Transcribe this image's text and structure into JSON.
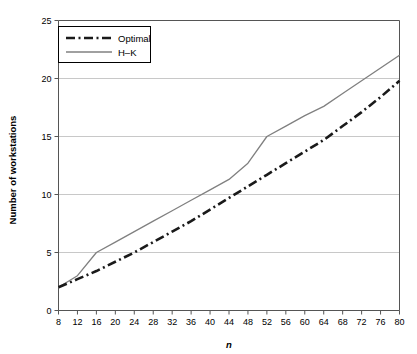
{
  "chart_data": {
    "type": "line",
    "title": "",
    "xlabel": "n",
    "ylabel": "Number of workstations",
    "xlim": [
      8,
      80
    ],
    "ylim": [
      0,
      25
    ],
    "xticks": [
      8,
      12,
      16,
      20,
      24,
      28,
      32,
      36,
      40,
      44,
      48,
      52,
      56,
      60,
      64,
      68,
      72,
      76,
      80
    ],
    "yticks": [
      0,
      5,
      10,
      15,
      20,
      25
    ],
    "grid": "horizontal",
    "legend_position": "top-left",
    "x": [
      8,
      12,
      16,
      20,
      24,
      28,
      32,
      36,
      40,
      44,
      48,
      52,
      56,
      60,
      64,
      68,
      72,
      76,
      80
    ],
    "series": [
      {
        "name": "Optimal",
        "style": "dash-dot",
        "color": "#1a1a1a",
        "values": [
          2.0,
          2.7,
          3.4,
          4.2,
          5.0,
          5.9,
          6.8,
          7.7,
          8.7,
          9.7,
          10.7,
          11.7,
          12.7,
          13.7,
          14.7,
          15.9,
          17.1,
          18.4,
          19.8
        ]
      },
      {
        "name": "H–K",
        "style": "solid",
        "color": "#808080",
        "values": [
          2.0,
          3.0,
          5.0,
          5.9,
          6.8,
          7.7,
          8.6,
          9.5,
          10.4,
          11.3,
          12.7,
          15.0,
          15.9,
          16.8,
          17.6,
          18.7,
          19.8,
          20.9,
          22.0
        ]
      }
    ]
  },
  "legend": {
    "entries": [
      {
        "label": "Optimal"
      },
      {
        "label": "H–K"
      }
    ]
  },
  "axes": {
    "y_title": "Number of workstations",
    "x_title": "n",
    "y_tick_labels": [
      "0",
      "5",
      "10",
      "15",
      "20",
      "25"
    ],
    "x_tick_labels": [
      "8",
      "12",
      "16",
      "20",
      "24",
      "28",
      "32",
      "36",
      "40",
      "44",
      "48",
      "52",
      "56",
      "60",
      "64",
      "68",
      "72",
      "76",
      "80"
    ]
  },
  "colors": {
    "optimal": "#1a1a1a",
    "hk": "#808080",
    "grid": "#c8c8c8",
    "axis": "#555555",
    "background": "#ffffff"
  }
}
